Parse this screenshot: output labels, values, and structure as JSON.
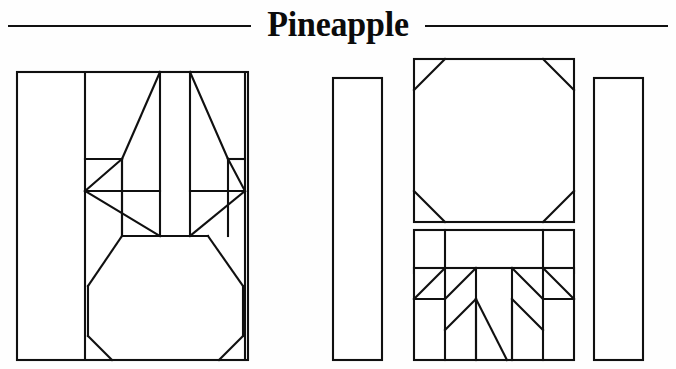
{
  "page": {
    "title": "Pineapple",
    "kind": "quilt-block-pattern-plate",
    "background_color": "#ffffff",
    "ink_color": "#101010"
  },
  "header": {
    "title": "Pineapple",
    "left_rule": true,
    "right_rule": true
  },
  "figure": {
    "caption": "",
    "blocks": [
      {
        "name": "assembled-block",
        "label": "Pineapple block",
        "x": 17,
        "y": 26,
        "width": 231,
        "height": 288,
        "pieces": [
          "left-background-strip",
          "right-background-strip",
          "crown-leaf-left-outer",
          "crown-leaf-left-inner",
          "crown-leaf-center",
          "crown-leaf-right-inner",
          "crown-leaf-right-outer",
          "body-octagon",
          "bottom-left-corner-triangle",
          "bottom-right-corner-triangle"
        ]
      },
      {
        "name": "side-strip-left",
        "label": "Background strip",
        "x": 333,
        "y": 32,
        "width": 49,
        "height": 282
      },
      {
        "name": "body-octagon-piece",
        "label": "Pineapple body",
        "x": 414,
        "y": 13,
        "width": 160,
        "height": 163
      },
      {
        "name": "center-bar-piece",
        "label": "Three-segment bar",
        "x": 414,
        "y": 184,
        "width": 160,
        "height": 43,
        "segments": 3
      },
      {
        "name": "crown-panel-piece",
        "label": "Crown leaf panel",
        "x": 414,
        "y": 222,
        "width": 160,
        "height": 92
      },
      {
        "name": "side-strip-right",
        "label": "Background strip",
        "x": 594,
        "y": 32,
        "width": 49,
        "height": 282
      }
    ]
  }
}
